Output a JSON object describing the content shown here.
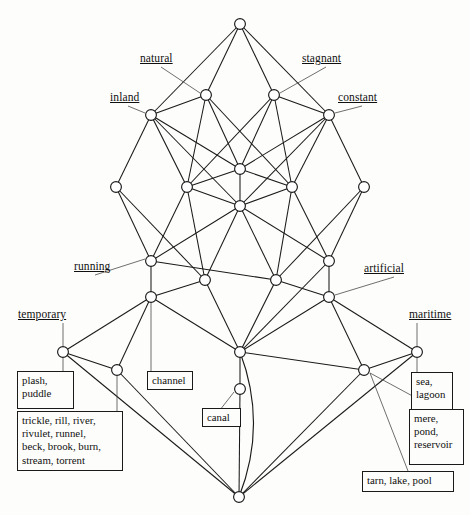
{
  "figure": {
    "type": "concept-lattice-hasse-diagram",
    "width": 470,
    "height": 515,
    "background_color": "#fdfdfb",
    "line_color": "#1a1a1a",
    "node_fill": "#ffffff"
  },
  "attributes": [
    {
      "name": "natural",
      "label": "natural",
      "label_x": 140,
      "label_y": 52,
      "node": "n_natural",
      "leader": "diagonal"
    },
    {
      "name": "stagnant",
      "label": "stagnant",
      "label_x": 302,
      "label_y": 52,
      "node": "n_stagnant",
      "leader": "diagonal"
    },
    {
      "name": "inland",
      "label": "inland",
      "label_x": 110,
      "label_y": 91,
      "node": "n_inland",
      "leader": "diagonal"
    },
    {
      "name": "constant",
      "label": "constant",
      "label_x": 338,
      "label_y": 91,
      "node": "n_constant",
      "leader": "diagonal"
    },
    {
      "name": "running",
      "label": "running",
      "label_x": 74,
      "label_y": 260,
      "node": "n_running",
      "leader": "diagonal"
    },
    {
      "name": "artificial",
      "label": "artificial",
      "label_x": 364,
      "label_y": 262,
      "node": "n_artificial",
      "leader": "diagonal"
    },
    {
      "name": "temporary",
      "label": "temporary",
      "label_x": 18,
      "label_y": 308,
      "node": "n_temporary",
      "leader": "vertical"
    },
    {
      "name": "maritime",
      "label": "maritime",
      "label_x": 409,
      "label_y": 308,
      "node": "n_maritime",
      "leader": "vertical"
    }
  ],
  "object_boxes": [
    {
      "name": "plash-puddle",
      "text": "plash,\npuddle",
      "x": 17,
      "y": 371,
      "w": 57,
      "h": 38,
      "node": "n_temporary",
      "leader": "vertical"
    },
    {
      "name": "trickle-group",
      "text": "trickle, rill, river,\nrivulet, runnel,\nbeck, brook, burn,\nstream, torrent",
      "x": 17,
      "y": 411,
      "w": 106,
      "h": 60,
      "node": "n_brooks",
      "leader": "vertical"
    },
    {
      "name": "channel",
      "text": "channel",
      "x": 147,
      "y": 371,
      "w": 46,
      "h": 19,
      "node": "n_channel",
      "leader": "vertical"
    },
    {
      "name": "canal",
      "text": "canal",
      "x": 202,
      "y": 408,
      "w": 39,
      "h": 19,
      "node": "n_canal",
      "leader": "diagonal"
    },
    {
      "name": "sea-lagoon",
      "text": "sea,\nlagoon",
      "x": 411,
      "y": 372,
      "w": 42,
      "h": 38,
      "node": "n_maritime",
      "leader": "vertical"
    },
    {
      "name": "mere-pond-reservoir",
      "text": "mere,\npond,\nreservoir",
      "x": 409,
      "y": 409,
      "w": 55,
      "h": 56,
      "node": "n_mere",
      "leader": "diagonal"
    },
    {
      "name": "tarn-lake-pool",
      "text": "tarn, lake, pool",
      "x": 362,
      "y": 471,
      "w": 92,
      "h": 21,
      "node": "n_tarn",
      "leader": "diagonal"
    }
  ],
  "nodes": [
    {
      "id": "n_top",
      "x": 240,
      "y": 24,
      "r": 5.4
    },
    {
      "id": "n_natural",
      "x": 206,
      "y": 95,
      "r": 5.4
    },
    {
      "id": "n_stagnant",
      "x": 274,
      "y": 95,
      "r": 5.4
    },
    {
      "id": "n_inland",
      "x": 151,
      "y": 115,
      "r": 5.4
    },
    {
      "id": "n_constant",
      "x": 329,
      "y": 115,
      "r": 5.4
    },
    {
      "id": "n_mid_c1",
      "x": 240,
      "y": 169,
      "r": 5.4
    },
    {
      "id": "n_l4_a",
      "x": 116,
      "y": 187,
      "r": 5.4
    },
    {
      "id": "n_l4_b",
      "x": 187,
      "y": 187,
      "r": 5.4
    },
    {
      "id": "n_l4_c",
      "x": 292,
      "y": 187,
      "r": 5.4
    },
    {
      "id": "n_l4_d",
      "x": 364,
      "y": 187,
      "r": 5.4
    },
    {
      "id": "n_mid_c2",
      "x": 240,
      "y": 206,
      "r": 5.4
    },
    {
      "id": "n_running",
      "x": 151,
      "y": 261,
      "r": 5.4
    },
    {
      "id": "n_artificial_up",
      "x": 329,
      "y": 261,
      "r": 5.4
    },
    {
      "id": "n_l5_b",
      "x": 205,
      "y": 280,
      "r": 5.4
    },
    {
      "id": "n_l5_c",
      "x": 276,
      "y": 280,
      "r": 5.4
    },
    {
      "id": "n_channel_up",
      "x": 151,
      "y": 297,
      "r": 5.4
    },
    {
      "id": "n_artificial",
      "x": 329,
      "y": 297,
      "r": 5.4
    },
    {
      "id": "n_temporary",
      "x": 63,
      "y": 352,
      "r": 5.4
    },
    {
      "id": "n_canal_up",
      "x": 240,
      "y": 352,
      "r": 5.4
    },
    {
      "id": "n_maritime",
      "x": 417,
      "y": 352,
      "r": 5.4
    },
    {
      "id": "n_brooks",
      "x": 117,
      "y": 370,
      "r": 5.4
    },
    {
      "id": "n_mere",
      "x": 364,
      "y": 370,
      "r": 5.4
    },
    {
      "id": "n_canal",
      "x": 240,
      "y": 389,
      "r": 5.4
    },
    {
      "id": "n_bottom",
      "x": 239,
      "y": 497,
      "r": 5.4
    },
    {
      "id": "n_channel",
      "x": 151,
      "y": 297,
      "r": 5.4
    },
    {
      "id": "n_tarn",
      "x": 364,
      "y": 370,
      "r": 5.4
    }
  ],
  "edges": [
    [
      "n_top",
      "n_inland"
    ],
    [
      "n_top",
      "n_natural"
    ],
    [
      "n_top",
      "n_stagnant"
    ],
    [
      "n_top",
      "n_constant"
    ],
    [
      "n_natural",
      "n_inland"
    ],
    [
      "n_natural",
      "n_l4_b"
    ],
    [
      "n_natural",
      "n_mid_c1"
    ],
    [
      "n_natural",
      "n_l4_c"
    ],
    [
      "n_stagnant",
      "n_mid_c1"
    ],
    [
      "n_stagnant",
      "n_l4_b"
    ],
    [
      "n_stagnant",
      "n_l4_c"
    ],
    [
      "n_stagnant",
      "n_constant"
    ],
    [
      "n_inland",
      "n_l4_a"
    ],
    [
      "n_inland",
      "n_l4_b"
    ],
    [
      "n_inland",
      "n_mid_c1"
    ],
    [
      "n_inland",
      "n_mid_c2"
    ],
    [
      "n_constant",
      "n_l4_d"
    ],
    [
      "n_constant",
      "n_l4_c"
    ],
    [
      "n_constant",
      "n_mid_c1"
    ],
    [
      "n_constant",
      "n_mid_c2"
    ],
    [
      "n_mid_c1",
      "n_mid_c2"
    ],
    [
      "n_mid_c1",
      "n_l4_b"
    ],
    [
      "n_mid_c1",
      "n_l4_c"
    ],
    [
      "n_l4_a",
      "n_running"
    ],
    [
      "n_l4_a",
      "n_l5_b"
    ],
    [
      "n_l4_b",
      "n_running"
    ],
    [
      "n_l4_b",
      "n_l5_b"
    ],
    [
      "n_l4_b",
      "n_mid_c2"
    ],
    [
      "n_l4_c",
      "n_l5_c"
    ],
    [
      "n_l4_c",
      "n_artificial_up"
    ],
    [
      "n_l4_c",
      "n_mid_c2"
    ],
    [
      "n_l4_d",
      "n_artificial_up"
    ],
    [
      "n_l4_d",
      "n_l5_c"
    ],
    [
      "n_mid_c2",
      "n_running"
    ],
    [
      "n_mid_c2",
      "n_l5_b"
    ],
    [
      "n_mid_c2",
      "n_l5_c"
    ],
    [
      "n_mid_c2",
      "n_artificial_up"
    ],
    [
      "n_running",
      "n_channel_up"
    ],
    [
      "n_running",
      "n_l5_c"
    ],
    [
      "n_l5_b",
      "n_channel_up"
    ],
    [
      "n_l5_b",
      "n_canal_up"
    ],
    [
      "n_l5_c",
      "n_canal_up"
    ],
    [
      "n_l5_c",
      "n_artificial"
    ],
    [
      "n_artificial_up",
      "n_artificial"
    ],
    [
      "n_artificial_up",
      "n_canal_up"
    ],
    [
      "n_channel_up",
      "n_temporary"
    ],
    [
      "n_channel_up",
      "n_brooks"
    ],
    [
      "n_channel_up",
      "n_canal_up"
    ],
    [
      "n_artificial",
      "n_maritime"
    ],
    [
      "n_artificial",
      "n_mere"
    ],
    [
      "n_artificial",
      "n_canal_up"
    ],
    [
      "n_temporary",
      "n_brooks"
    ],
    [
      "n_temporary",
      "n_bottom"
    ],
    [
      "n_canal_up",
      "n_canal"
    ],
    [
      "n_canal_up",
      "n_mere"
    ],
    [
      "n_maritime",
      "n_mere"
    ],
    [
      "n_maritime",
      "n_bottom"
    ],
    [
      "n_brooks",
      "n_bottom"
    ],
    [
      "n_mere",
      "n_bottom"
    ],
    [
      "n_canal",
      "n_bottom"
    ]
  ],
  "curved_edges": [
    {
      "from": "n_canal_up",
      "to": "n_bottom",
      "bulge": 28
    }
  ]
}
